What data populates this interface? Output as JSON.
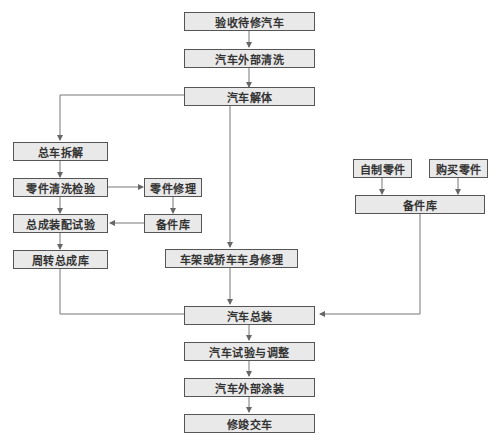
{
  "nodes": {
    "accept": "验收待修汽车",
    "wash_ext": "汽车外部清洗",
    "disassemble": "汽车解体",
    "total_disassembly": "总车拆解",
    "parts_clean": "零件清洗检验",
    "parts_repair": "零件修理",
    "spare_left": "备件库",
    "assembly_test": "总成装配试验",
    "turnover": "周转总成库",
    "frame_body": "车架或轿车车身修理",
    "self_made": "自制零件",
    "purchased": "购买零件",
    "spare_right": "备件库",
    "final_assembly": "汽车总装",
    "test_adjust": "汽车试验与调整",
    "paint": "汽车外部涂装",
    "deliver": "修竣交车"
  },
  "colors": {
    "box_fill": "#e9e9e9",
    "box_border": "#555555",
    "line": "#666666"
  }
}
